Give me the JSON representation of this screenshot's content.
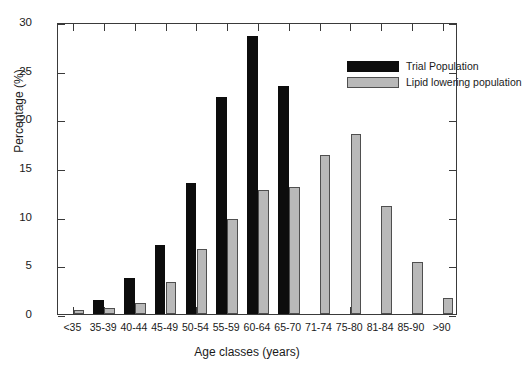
{
  "chart_data": {
    "type": "bar",
    "title": "",
    "xlabel": "Age classes (years)",
    "ylabel": "Percentage (%)",
    "ylim": [
      0,
      30
    ],
    "yticks": [
      0,
      5,
      10,
      15,
      20,
      25,
      30
    ],
    "grid": false,
    "legend_position": "top-right",
    "categories": [
      "<35",
      "35-39",
      "40-44",
      "45-49",
      "50-54",
      "55-59",
      "60-64",
      "65-70",
      "71-74",
      "75-80",
      "81-84",
      "85-90",
      ">90"
    ],
    "series": [
      {
        "name": "Trial Population",
        "color": "#0d0d0d",
        "values": [
          0,
          1.4,
          3.7,
          7.1,
          13.5,
          22.3,
          28.6,
          23.4,
          0,
          0,
          0,
          0,
          0
        ]
      },
      {
        "name": "Lipid lowering population",
        "color": "#b9b9b9",
        "values": [
          0.4,
          0.6,
          1.1,
          3.3,
          6.7,
          9.8,
          12.7,
          13.1,
          16.3,
          18.5,
          11.1,
          5.3,
          1.6
        ]
      }
    ]
  },
  "legend": {
    "items": [
      {
        "label": "Trial Population",
        "swatch": "trial"
      },
      {
        "label": "Lipid lowering population",
        "swatch": "lipid"
      }
    ]
  },
  "axes": {
    "y_title": "Percentage (%)",
    "x_title": "Age classes (years)"
  }
}
